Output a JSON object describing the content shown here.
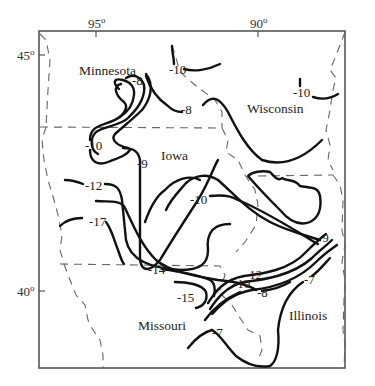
{
  "map": {
    "axes": {
      "longitude_ticks": [
        {
          "label": "95",
          "sup": "o"
        },
        {
          "label": "90",
          "sup": "o"
        }
      ],
      "latitude_ticks": [
        {
          "label": "45",
          "sup": "o"
        },
        {
          "label": "40",
          "sup": "o"
        }
      ]
    },
    "states": [
      {
        "name": "Minnesota"
      },
      {
        "name": "Wisconsin"
      },
      {
        "name": "Iowa"
      },
      {
        "name": "Missouri"
      },
      {
        "name": "Illinois"
      }
    ],
    "contour_labels": [
      "-8",
      "-10",
      "-8",
      "-10",
      "-10",
      "-9",
      "-12",
      "-17",
      "-10",
      "-14",
      "-15",
      "-12",
      "-10",
      "-8",
      "-9",
      "-7",
      "-7"
    ],
    "colors": {
      "contour": "#111111",
      "border": "#666666",
      "frame": "#555555",
      "background": "#ffffff"
    }
  }
}
